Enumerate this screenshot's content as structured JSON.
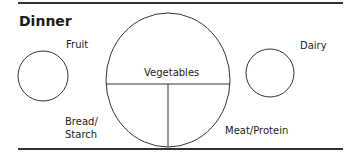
{
  "title": "Dinner",
  "labels": {
    "fruit": "Fruit",
    "vegetables": "Vegetables",
    "dairy": "Dairy",
    "bread_line1": "Bread/",
    "bread_line2": "Starch",
    "meat": "Meat/Protein"
  },
  "colors": {
    "stroke": "#333333",
    "text": "#222222",
    "background": "#ffffff"
  }
}
